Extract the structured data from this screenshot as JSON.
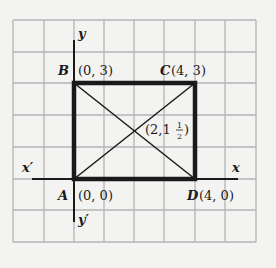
{
  "diagram": {
    "type": "coordinate-plane-rectangle",
    "grid": {
      "columns": 8,
      "rows": 7,
      "color": "#b4b4b4"
    },
    "axes": {
      "x_label": "x",
      "x_neg_label": "x′",
      "y_label": "y",
      "y_neg_label": "y′"
    },
    "points": {
      "A": {
        "letter": "A",
        "coords": "(0, 0)"
      },
      "B": {
        "letter": "B",
        "coords": "(0, 3)"
      },
      "C": {
        "letter": "C",
        "coords": "(4, 3)"
      },
      "D": {
        "letter": "D",
        "coords": "(4, 0)"
      }
    },
    "center": {
      "prefix": "(2,1",
      "frac_num": "1",
      "frac_den": "2",
      "suffix": ")"
    },
    "colors": {
      "background": "#f3f3f1",
      "ink": "#1a1a1a",
      "grid": "#b4b4b4"
    }
  }
}
